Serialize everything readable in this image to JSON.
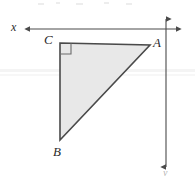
{
  "figure": {
    "colors": {
      "triangle_fill": "#e8e8e8",
      "triangle_stroke": "#4a4a4a",
      "axis_stroke": "#4a4a4a",
      "label_color": "#2b2b2b",
      "background": "#ffffff",
      "artifact": "#ededed"
    },
    "axes": {
      "x_axis": {
        "label": "x",
        "orientation": "horizontal",
        "y": 29,
        "x_start": 25,
        "x_end": 180,
        "arrow_left": true,
        "arrow_right": true
      },
      "y_axis": {
        "label": "y",
        "orientation": "vertical",
        "x": 166,
        "y_start": 14,
        "y_end": 172,
        "arrow_top": true,
        "arrow_bottom": true
      },
      "origin": {
        "x": 166,
        "y": 29
      }
    },
    "triangle": {
      "vertices": [
        {
          "name": "C",
          "x": 60,
          "y": 43,
          "label": "C",
          "label_position": "upper-left"
        },
        {
          "name": "A",
          "x": 150,
          "y": 45,
          "label": "A",
          "label_position": "right"
        },
        {
          "name": "B",
          "x": 60,
          "y": 140,
          "label": "B",
          "label_position": "below"
        }
      ],
      "points_path": "60,43 150,45 60,140",
      "right_angle_at": "C",
      "right_angle_marker_size": 10,
      "fill": "#e8e8e8",
      "stroke": "#4a4a4a",
      "stroke_width": 1.6
    }
  }
}
